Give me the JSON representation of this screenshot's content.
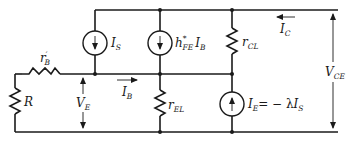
{
  "diagram": {
    "type": "equivalent-circuit",
    "colors": {
      "ink": "#1a1a1a",
      "background": "#ffffff"
    },
    "components": {
      "R": {
        "main": "R",
        "sub": ""
      },
      "rB": {
        "main": "r",
        "prime": "′",
        "sub": "B"
      },
      "IS": {
        "main": "I",
        "sub": "S"
      },
      "hFE": {
        "h": "h",
        "sup": "*",
        "sub": "FE",
        "I": "I",
        "Isub": "B"
      },
      "rCL": {
        "main": "r",
        "sub": "CL"
      },
      "rEL": {
        "main": "r",
        "sub": "EL"
      },
      "IE": {
        "main": "I",
        "sub": "E",
        "eq": "= − λ",
        "I2": "I",
        "sub2": "S"
      }
    },
    "labels": {
      "IC": {
        "main": "I",
        "sub": "C"
      },
      "IB": {
        "main": "I",
        "sub": "B"
      },
      "VE": {
        "main": "V",
        "sub": "E"
      },
      "VCE": {
        "main": "V",
        "sub": "CE"
      }
    }
  }
}
